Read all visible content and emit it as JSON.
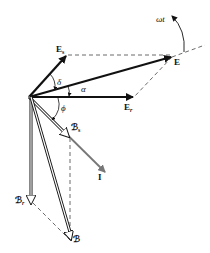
{
  "diagram": {
    "type": "phasor-diagram",
    "labels": {
      "E_s": {
        "main": "E",
        "sub": "s"
      },
      "E": {
        "main": "E"
      },
      "E_r": {
        "main": "E",
        "sub": "r"
      },
      "omega_t": "ωt",
      "delta": "δ",
      "alpha": "α",
      "phi": "ϕ",
      "B_s": {
        "main": "ℬ",
        "sub": "s"
      },
      "I": "I",
      "B_r": {
        "main": "ℬ",
        "sub": "r"
      },
      "B": "ℬ"
    },
    "colors": {
      "stroke": "#111111",
      "current": "#777777",
      "dashed": "#444444"
    }
  }
}
